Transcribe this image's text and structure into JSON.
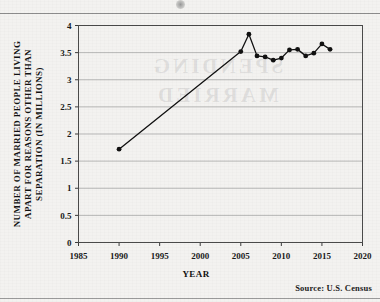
{
  "page": {
    "background_color": "#f3f2f0",
    "ink_color": "#111111",
    "bleed_through_text": "SPENDING MARRIED"
  },
  "source_note": "Source:  U.S. Census",
  "axis": {
    "x_title": "YEAR",
    "y_title_line1": "NUMBER OF MARRIED PEOPLE LIVING",
    "y_title_line2": "APART FOR REASONS OTHER THAN",
    "y_title_line3": "SEPARATION (IN MILLIONS)"
  },
  "chart_data": {
    "type": "line",
    "title": "",
    "subtitle": "",
    "xlabel": "YEAR",
    "ylabel": "NUMBER OF MARRIED PEOPLE LIVING APART FOR REASONS OTHER THAN SEPARATION (IN MILLIONS)",
    "xlim": [
      1985,
      2020
    ],
    "ylim": [
      0,
      4
    ],
    "xticks": [
      1985,
      1990,
      1995,
      2000,
      2005,
      2010,
      2015,
      2020
    ],
    "yticks": [
      0,
      0.5,
      1,
      1.5,
      2,
      2.5,
      3,
      3.5,
      4
    ],
    "xtick_labels": [
      "1985",
      "1990",
      "1995",
      "2000",
      "2005",
      "2010",
      "2015",
      "2020"
    ],
    "ytick_labels": [
      "0",
      "0.5",
      "1",
      "1.5",
      "2",
      "2.5",
      "3",
      "3.5",
      "4"
    ],
    "grid": "horizontal",
    "legend": "none",
    "marker": "filled-circle",
    "line_color": "#111111",
    "marker_color": "#111111",
    "x": [
      1990,
      2005,
      2006,
      2007,
      2008,
      2009,
      2010,
      2011,
      2012,
      2013,
      2014,
      2015,
      2016
    ],
    "values": [
      1.72,
      3.52,
      3.84,
      3.44,
      3.42,
      3.36,
      3.4,
      3.55,
      3.56,
      3.44,
      3.49,
      3.66,
      3.56
    ],
    "series": [
      {
        "name": "Married people living apart for reasons other than separation",
        "values": [
          1.72,
          3.52,
          3.84,
          3.44,
          3.42,
          3.36,
          3.4,
          3.55,
          3.56,
          3.44,
          3.49,
          3.66,
          3.56
        ]
      }
    ],
    "annotations": []
  }
}
